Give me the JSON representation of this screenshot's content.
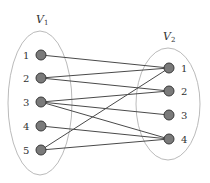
{
  "diagram": {
    "type": "bipartite-graph",
    "sets": [
      {
        "id": "V1",
        "label": "V",
        "subscript": "1",
        "nodes": [
          "1",
          "2",
          "3",
          "4",
          "5"
        ]
      },
      {
        "id": "V2",
        "label": "V",
        "subscript": "2",
        "nodes": [
          "1",
          "2",
          "3",
          "4"
        ]
      }
    ],
    "edges": [
      {
        "from": "V1.1",
        "to": "V2.1"
      },
      {
        "from": "V1.2",
        "to": "V2.1"
      },
      {
        "from": "V1.2",
        "to": "V2.2"
      },
      {
        "from": "V1.3",
        "to": "V2.2"
      },
      {
        "from": "V1.3",
        "to": "V2.3"
      },
      {
        "from": "V1.3",
        "to": "V2.4"
      },
      {
        "from": "V1.4",
        "to": "V2.4"
      },
      {
        "from": "V1.5",
        "to": "V2.1"
      },
      {
        "from": "V1.5",
        "to": "V2.4"
      }
    ],
    "colors": {
      "node_fill": "#7a7a7a",
      "edge": "#4a4a4a",
      "ellipse": "#a8a8a8"
    }
  }
}
